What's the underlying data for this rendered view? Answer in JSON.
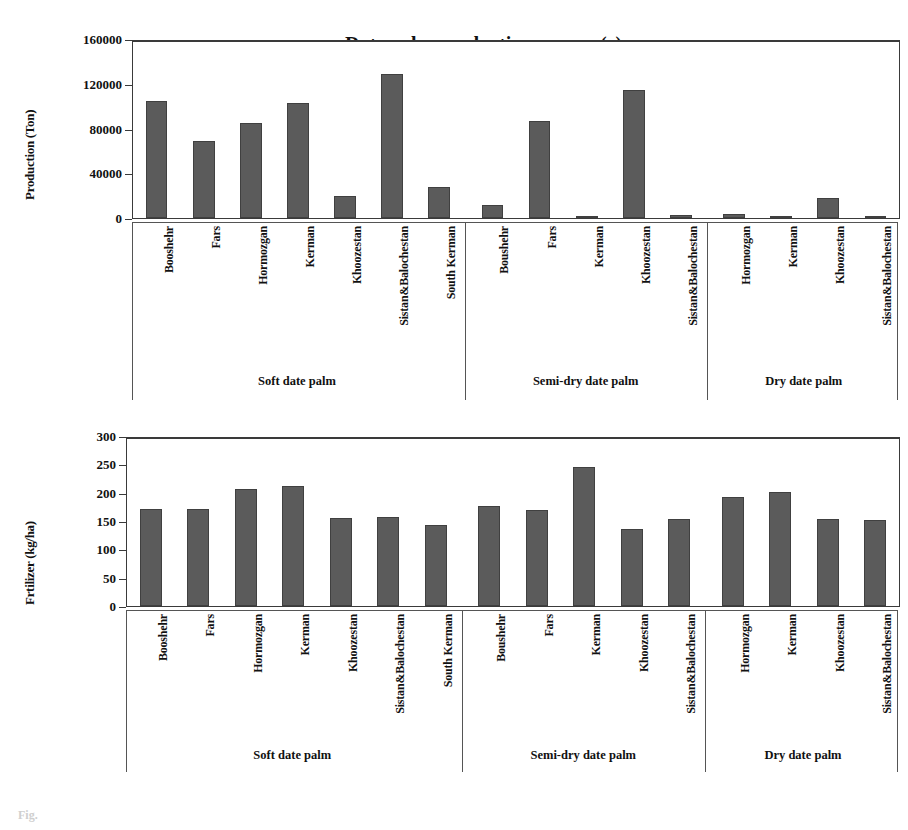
{
  "figure": {
    "caption_fragment": "Fig."
  },
  "panels": [
    {
      "key": "production",
      "panel_letter": "(c)",
      "title": "Date palm production",
      "ylabel": "Production (Ton)",
      "ticks": [
        "0",
        "40000",
        "80000",
        "120000",
        "160000"
      ],
      "groups": [
        {
          "label": "Soft date palm"
        },
        {
          "label": "Semi-dry date palm"
        },
        {
          "label": "Dry date palm"
        }
      ]
    },
    {
      "key": "fertilizer",
      "panel_letter": "(d)",
      "title": "Date palm chemical fertilizer",
      "ylabel": "Frtilizer (kg/ha)",
      "ticks": [
        "0",
        "50",
        "100",
        "150",
        "200",
        "250",
        "300"
      ],
      "groups": [
        {
          "label": "Soft date palm"
        },
        {
          "label": "Semi-dry date palm"
        },
        {
          "label": "Dry date palm"
        }
      ]
    }
  ],
  "chart_data": [
    {
      "type": "bar",
      "id": "c",
      "title": "Date palm production",
      "panel_letter": "(c)",
      "xlabel": "",
      "ylabel": "Production (Ton)",
      "ylim": [
        0,
        160000
      ],
      "ytick_step": 40000,
      "yticks": [
        0,
        40000,
        80000,
        120000,
        160000
      ],
      "grid": false,
      "legend": false,
      "bar_color": "#5b5b5b",
      "groups": [
        {
          "name": "Soft date palm",
          "categories": [
            "Booshehr",
            "Fars",
            "Hormozgan",
            "Kerman",
            "Khoozestan",
            "Sistan&Balochestan",
            "South Kerman"
          ],
          "values": [
            105000,
            69000,
            85000,
            103000,
            19500,
            129000,
            28000
          ]
        },
        {
          "name": "Semi-dry date palm",
          "categories": [
            "Boushehr",
            "Fars",
            "Kerman",
            "Khoozestan",
            "Sistan&Balochestan"
          ],
          "values": [
            12000,
            87000,
            1000,
            114000,
            3000
          ]
        },
        {
          "name": "Dry date palm",
          "categories": [
            "Hormozgan",
            "Kerman",
            "Khoozestan",
            "Sistan&Balochestan"
          ],
          "values": [
            4000,
            800,
            18000,
            1500
          ]
        }
      ]
    },
    {
      "type": "bar",
      "id": "d",
      "title": "Date palm chemical fertilizer",
      "panel_letter": "(d)",
      "xlabel": "",
      "ylabel": "Frtilizer (kg/ha)",
      "ylim": [
        0,
        300
      ],
      "ytick_step": 50,
      "yticks": [
        0,
        50,
        100,
        150,
        200,
        250,
        300
      ],
      "grid": false,
      "legend": false,
      "bar_color": "#5b5b5b",
      "groups": [
        {
          "name": "Soft date palm",
          "categories": [
            "Booshehr",
            "Fars",
            "Hormozgan",
            "Kerman",
            "Khoozestan",
            "Sistan&Balochestan",
            "South Kerman"
          ],
          "values": [
            172,
            171,
            206,
            211,
            155,
            157,
            143
          ]
        },
        {
          "name": "Semi-dry date palm",
          "categories": [
            "Boushehr",
            "Fars",
            "Kerman",
            "Khoozestan",
            "Sistan&Balochestan"
          ],
          "values": [
            177,
            169,
            246,
            136,
            154
          ]
        },
        {
          "name": "Dry date palm",
          "categories": [
            "Hormozgan",
            "Kerman",
            "Khoozestan",
            "Sistan&Balochestan"
          ],
          "values": [
            192,
            202,
            153,
            151
          ]
        }
      ]
    }
  ]
}
